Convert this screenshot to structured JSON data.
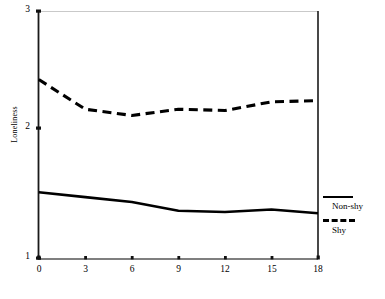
{
  "chart_data": {
    "type": "line",
    "title": "",
    "xlabel": "",
    "ylabel": "Loneliness",
    "xlim": [
      0,
      18
    ],
    "ylim": [
      1,
      3
    ],
    "x": [
      0,
      3,
      6,
      9,
      12,
      15,
      18
    ],
    "xticks": [
      "0",
      "3",
      "6",
      "9",
      "12",
      "15",
      "18"
    ],
    "yticks": [
      "1",
      "2",
      "3"
    ],
    "grid": false,
    "legend_position": "right",
    "series": [
      {
        "name": "Non-shy",
        "style": "solid",
        "color": "#000000",
        "values": [
          1.54,
          1.5,
          1.46,
          1.39,
          1.38,
          1.4,
          1.37
        ]
      },
      {
        "name": "Shy",
        "style": "dashed",
        "color": "#000000",
        "values": [
          2.45,
          2.21,
          2.16,
          2.21,
          2.2,
          2.27,
          2.28
        ]
      }
    ]
  },
  "axes": {
    "y_title": "Loneliness",
    "y_tick_labels": [
      "3",
      "2",
      "1"
    ],
    "x_tick_labels": [
      "0",
      "3",
      "6",
      "9",
      "12",
      "15",
      "18"
    ]
  },
  "legend": {
    "entries": [
      {
        "label": "Non-shy",
        "style": "solid"
      },
      {
        "label": "Shy",
        "style": "dashed"
      }
    ]
  },
  "colors": {
    "line": "#000000",
    "axis": "#1a1a1a",
    "gridline": "#c8c8c8",
    "background": "#ffffff"
  }
}
